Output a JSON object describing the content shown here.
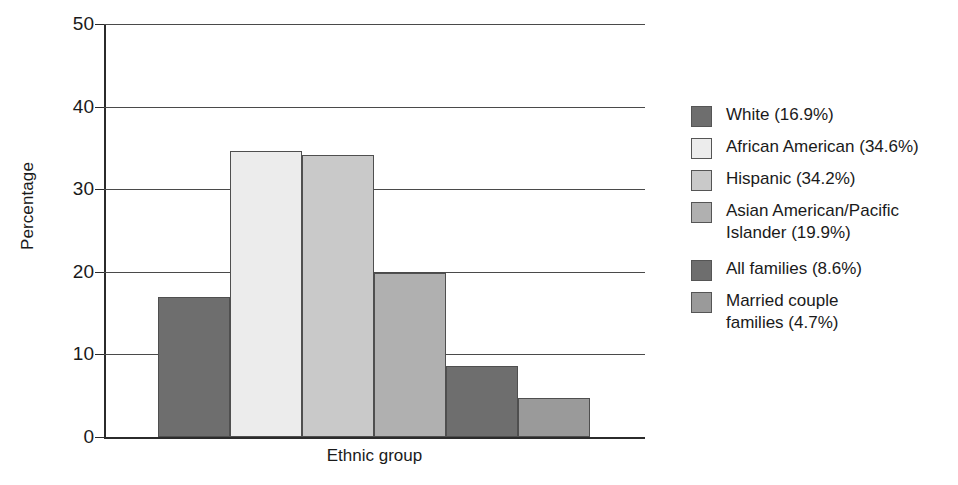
{
  "chart_data": {
    "type": "bar",
    "title": "",
    "xlabel": "Ethnic group",
    "ylabel": "Percentage",
    "ylim": [
      0,
      50
    ],
    "yticks": [
      0,
      10,
      20,
      30,
      40,
      50
    ],
    "grid": true,
    "legend_position": "right",
    "categories": [
      "White",
      "African American",
      "Hispanic",
      "Asian American/Pacific Islander",
      "All families",
      "Married couple families"
    ],
    "values": [
      16.9,
      34.6,
      34.2,
      19.9,
      8.6,
      4.7
    ],
    "colors": [
      "#6e6e6e",
      "#ececec",
      "#c9c9c9",
      "#b0b0b0",
      "#6e6e6e",
      "#9a9a9a"
    ]
  },
  "axes": {
    "y_title": "Percentage",
    "x_title": "Ethnic group",
    "y_tick_labels": [
      "50",
      "40",
      "30",
      "20",
      "10",
      "0"
    ]
  },
  "legend": {
    "items": [
      {
        "label": "White (16.9%)",
        "color": "#6e6e6e"
      },
      {
        "label": "African American (34.6%)",
        "color": "#ececec"
      },
      {
        "label": "Hispanic (34.2%)",
        "color": "#c9c9c9"
      },
      {
        "label": "Asian American/Pacific\nIslander (19.9%)",
        "color": "#b0b0b0"
      },
      {
        "label": "All families (8.6%)",
        "color": "#6e6e6e"
      },
      {
        "label": "Married couple\nfamilies (4.7%)",
        "color": "#9a9a9a"
      }
    ]
  }
}
